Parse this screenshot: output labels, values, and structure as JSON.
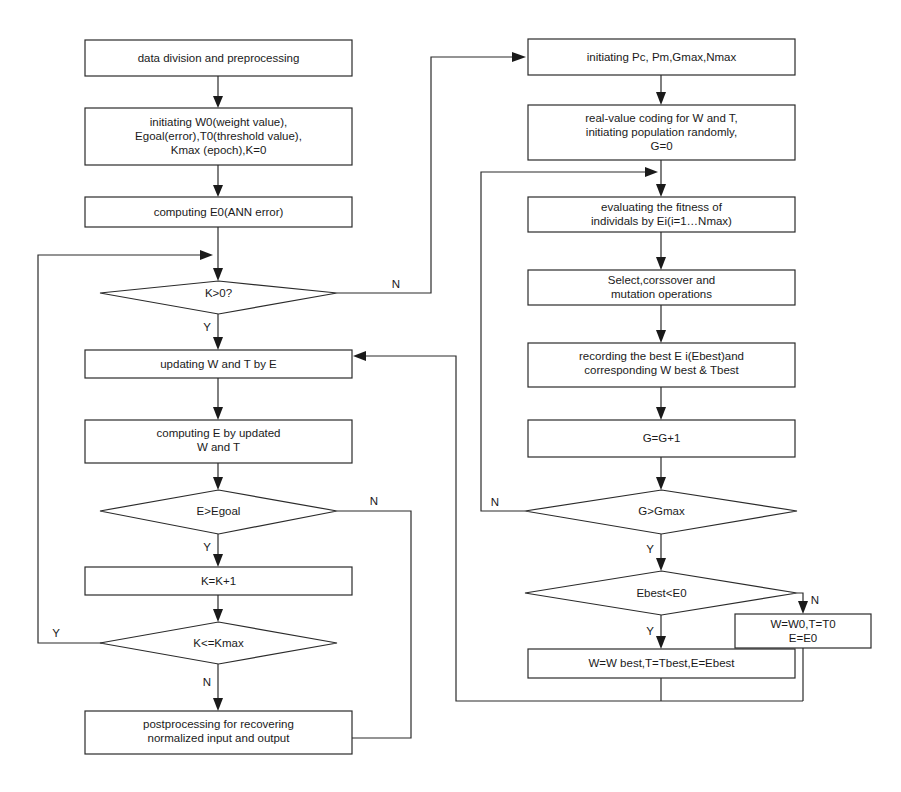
{
  "diagram": {
    "colors": {
      "background": "#ffffff",
      "stroke": "#2b2b2b",
      "text": "#1a1a1a"
    },
    "nodes": {
      "data_division": {
        "lines": [
          "data division and preprocessing"
        ]
      },
      "initiating_w0": {
        "lines": [
          "initiating W0(weight value),",
          "Egoal(error),T0(threshold value),",
          "Kmax (epoch),K=0"
        ]
      },
      "computing_e0": {
        "lines": [
          "computing E0(ANN error)"
        ]
      },
      "k_gt_0": {
        "lines": [
          "K>0?"
        ]
      },
      "updating_wt": {
        "lines": [
          "updating W and T by E"
        ]
      },
      "computing_e": {
        "lines": [
          "computing E by updated",
          "W and T"
        ]
      },
      "e_gt_egoal": {
        "lines": [
          "E>Egoal"
        ]
      },
      "k_increment": {
        "lines": [
          "K=K+1"
        ]
      },
      "k_le_kmax": {
        "lines": [
          "K<=Kmax"
        ]
      },
      "postprocessing": {
        "lines": [
          "postprocessing for recovering",
          "normalized input and output"
        ]
      },
      "initiating_pc": {
        "lines": [
          "initiating  Pc, Pm,Gmax,Nmax"
        ]
      },
      "real_value_coding": {
        "lines": [
          "real-value coding for W and T,",
          "initiating population randomly,",
          "G=0"
        ]
      },
      "evaluating_fitness": {
        "lines": [
          "evaluating the fitness of",
          "individals by Ei(i=1…Nmax)"
        ]
      },
      "select_crossover": {
        "lines": [
          "Select,corssover and",
          "mutation operations"
        ]
      },
      "recording_best": {
        "lines": [
          "recording the best E i(Ebest)and",
          "corresponding W best & Tbest"
        ]
      },
      "g_increment": {
        "lines": [
          "G=G+1"
        ]
      },
      "g_gt_gmax": {
        "lines": [
          "G>Gmax"
        ]
      },
      "ebest_lt_e0": {
        "lines": [
          "Ebest<E0"
        ]
      },
      "assign_best": {
        "lines": [
          "W=W best,T=Tbest,E=Ebest"
        ]
      },
      "assign_initial": {
        "lines": [
          "W=W0,T=T0",
          "E=E0"
        ]
      }
    },
    "edge_labels": {
      "k_gt_0_no": "N",
      "k_gt_0_yes": "Y",
      "e_gt_egoal_no": "N",
      "e_gt_egoal_yes": "Y",
      "k_le_kmax_yes": "Y",
      "k_le_kmax_no": "N",
      "g_gt_gmax_no": "N",
      "g_gt_gmax_yes": "Y",
      "ebest_no": "N",
      "ebest_yes": "Y"
    }
  }
}
